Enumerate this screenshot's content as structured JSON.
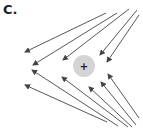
{
  "panel": {
    "label": "C.",
    "description": "Electric field lines around a positive charge in an external field"
  },
  "charge": {
    "sign": "+",
    "cx": 84,
    "cy": 66,
    "r": 11,
    "fill": "#d4d4d4",
    "sign_color": "#222222"
  },
  "arrow_color": "#444444",
  "arrows": [
    {
      "x1": 106,
      "y1": 13,
      "x2": 25,
      "y2": 52
    },
    {
      "x1": 117,
      "y1": 13,
      "x2": 33,
      "y2": 65
    },
    {
      "x1": 129,
      "y1": 9,
      "x2": 63,
      "y2": 60
    },
    {
      "x1": 137,
      "y1": 10,
      "x2": 100,
      "y2": 55
    },
    {
      "x1": 139,
      "y1": 15,
      "x2": 107,
      "y2": 62
    },
    {
      "x1": 107,
      "y1": 122,
      "x2": 25,
      "y2": 85
    },
    {
      "x1": 118,
      "y1": 126,
      "x2": 32,
      "y2": 70
    },
    {
      "x1": 128,
      "y1": 127,
      "x2": 62,
      "y2": 77
    },
    {
      "x1": 132,
      "y1": 127,
      "x2": 89,
      "y2": 87
    },
    {
      "x1": 136,
      "y1": 125,
      "x2": 101,
      "y2": 82
    },
    {
      "x1": 139,
      "y1": 118,
      "x2": 108,
      "y2": 74
    }
  ]
}
